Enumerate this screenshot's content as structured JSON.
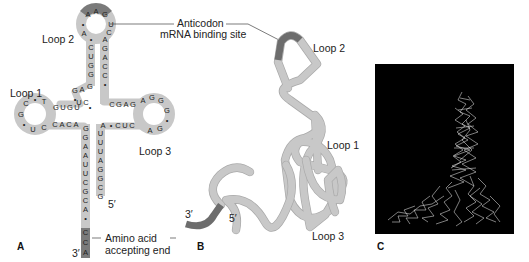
{
  "figure": {
    "panels": {
      "A": {
        "label": "A",
        "title": "tRNA cloverleaf secondary structure",
        "loops": {
          "loop1": "Loop 1",
          "loop2": "Loop 2",
          "loop3": "Loop 3"
        },
        "anticodon_label_line1": "Anticodon",
        "anticodon_label_line2": "mRNA binding site",
        "acceptor_label_line1": "Amino acid",
        "acceptor_label_line2": "accepting end",
        "end3": "3′",
        "end5": "5′",
        "anticodon": [
          "A",
          "A",
          "G"
        ],
        "loop2_left": [
          "•",
          "A",
          "•"
        ],
        "loop2_right": [
          "U",
          "C"
        ],
        "anticodon_stem_left": [
          "C",
          "U",
          "G",
          "G"
        ],
        "anticodon_stem_right": [
          "A",
          "G",
          "A",
          "C",
          "C",
          "•"
        ],
        "d_arm_upper": [
          "G",
          "A",
          "G"
        ],
        "d_arm_middle": [
          "•",
          "U",
          "C",
          "•"
        ],
        "loop1_top": [
          "G",
          "U",
          "G",
          "U"
        ],
        "loop1_ring": [
          "C",
          "•",
          "T",
          "G",
          "•",
          "U",
          "C"
        ],
        "loop1_bottom": [
          "C",
          "A",
          "C",
          "A",
          "G"
        ],
        "t_arm_top": [
          "C",
          "G",
          "A",
          "G"
        ],
        "loop3_ring": [
          "A",
          "G",
          "G",
          "G",
          "•",
          "G",
          "A"
        ],
        "t_arm_bottom": [
          "A",
          "•",
          "C",
          "U",
          "C"
        ],
        "acceptor_left": [
          "G",
          "A",
          "A",
          "U",
          "U",
          "C",
          "G",
          "C",
          "A"
        ],
        "acceptor_tail": [
          "C",
          "C",
          "A"
        ],
        "acceptor_right": [
          "U",
          "U",
          "U",
          "A",
          "G",
          "G",
          "C",
          "G"
        ]
      },
      "B": {
        "label": "B",
        "title": "tRNA tertiary structure (L-shape ribbon)",
        "loop2": "Loop 2",
        "loop1": "Loop 1",
        "loop3": "Loop 3",
        "end3": "3′",
        "end5": "5′"
      },
      "C": {
        "label": "C",
        "title": "Computer-generated 3D model of tRNA"
      }
    },
    "colors": {
      "backbone": "#c8c8c8",
      "highlight": "#6d6d6d",
      "model_background": "#000000",
      "model_lines": "#e6e6e6"
    }
  }
}
